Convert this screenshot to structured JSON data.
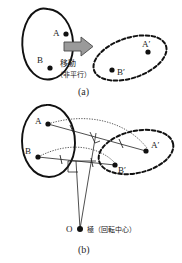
{
  "figure": {
    "title_a_caption": "(a)",
    "title_b_caption": "(b)",
    "panel_a": {
      "source_shape_name": "solid-blob-source",
      "target_shape_name": "dashed-blob-target",
      "points": [
        {
          "id": "A",
          "label": "A",
          "x": 66,
          "y": 34
        },
        {
          "id": "B",
          "label": "B",
          "x": 50,
          "y": 68
        },
        {
          "id": "Ap",
          "label": "A′",
          "x": 148,
          "y": 52
        },
        {
          "id": "Bp",
          "label": "B′",
          "x": 112,
          "y": 70
        }
      ],
      "arrow_label_main": "移動",
      "arrow_label_sub": "（非平行）",
      "arrow_name": "move-block-arrow"
    },
    "panel_b": {
      "source_shape_name": "solid-blob-source",
      "target_shape_name": "dashed-blob-target",
      "points": [
        {
          "id": "A",
          "label": "A",
          "x": 48,
          "y": 124
        },
        {
          "id": "B",
          "label": "B",
          "x": 38,
          "y": 157
        },
        {
          "id": "Ap",
          "label": "A′",
          "x": 146,
          "y": 151
        },
        {
          "id": "Bp",
          "label": "B′",
          "x": 115,
          "y": 165
        },
        {
          "id": "O",
          "label": "O",
          "x": 80,
          "y": 229
        }
      ],
      "pole_label": "極（回転中心）",
      "pole_point_name": "pole-point-O"
    },
    "colors": {
      "stroke": "#111111",
      "arrow_fill": "#9a9a9a",
      "arrow_stroke": "#4a4a4a",
      "background": "#ffffff"
    }
  }
}
